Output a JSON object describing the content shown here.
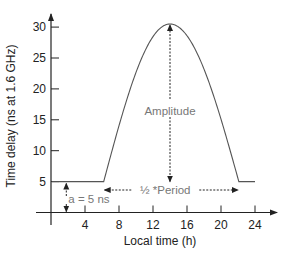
{
  "chart_data": {
    "type": "line",
    "title": "",
    "xlabel": "Local time (h)",
    "ylabel": "Time delay (ns at 1.6 GHz)",
    "xlim": [
      0,
      25
    ],
    "ylim": [
      0,
      31
    ],
    "xticks": [
      4,
      8,
      12,
      16,
      20,
      24
    ],
    "yticks": [
      5,
      10,
      15,
      20,
      25,
      30
    ],
    "grid": false,
    "legend": null,
    "series": [
      {
        "name": "Klobuchar ionospheric delay model",
        "model": "half-cosine",
        "baseline_ns": 5,
        "peak_time_h": 14,
        "peak_value_ns": 30.5,
        "start_time_h": 6.2,
        "end_time_h": 22.1,
        "x": [
          0,
          6.2,
          8,
          10,
          12,
          14,
          16,
          18,
          20,
          22.1,
          24
        ],
        "y": [
          5,
          5,
          10.5,
          19.5,
          27.1,
          30.5,
          27.1,
          19.5,
          10.5,
          5,
          5
        ]
      }
    ],
    "annotations": [
      {
        "text": "Amplitude",
        "type": "vertical-double-arrow",
        "x": 14,
        "from": 5,
        "to": 30.5
      },
      {
        "text": "½ *Period",
        "type": "horizontal-double-arrow",
        "y": 3.5,
        "from": 6.2,
        "to": 22.1
      },
      {
        "text": "a = 5 ns",
        "type": "vertical-double-arrow",
        "x": 2,
        "from": 0,
        "to": 5
      }
    ]
  },
  "colors": {
    "axis": "#222222",
    "curve": "#555555",
    "annotation": "#777777",
    "text": "#222222"
  },
  "labels": {
    "x_axis_title": "Local time (h)",
    "y_axis_title": "Time delay (ns at 1.6 GHz)",
    "amplitude": "Amplitude",
    "half_period": "½ *Period",
    "offset": "a = 5 ns"
  }
}
